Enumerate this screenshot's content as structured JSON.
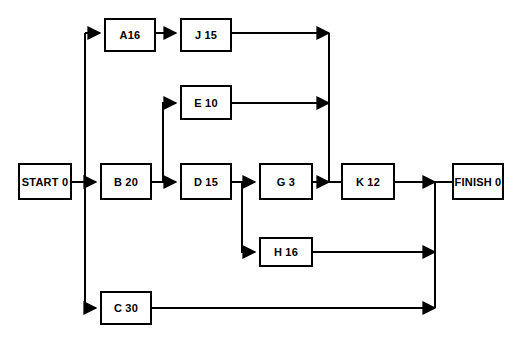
{
  "diagram": {
    "type": "activity-on-node-network",
    "canvas": {
      "width": 524,
      "height": 344
    },
    "style": {
      "background_color": "#ffffff",
      "line_color": "#000000",
      "node_fill": "#ffffff",
      "node_border": "#000000",
      "text_color": "#000000"
    },
    "nodes": [
      {
        "id": "start",
        "label": "START 0",
        "activity": "START",
        "duration": "0",
        "x": 18,
        "y": 163,
        "w": 54,
        "h": 37
      },
      {
        "id": "a",
        "label": "A16",
        "activity": "A",
        "duration": "16",
        "x": 104,
        "y": 18,
        "w": 52,
        "h": 34
      },
      {
        "id": "j",
        "label": "J 15",
        "activity": "J",
        "duration": "15",
        "x": 180,
        "y": 18,
        "w": 52,
        "h": 34
      },
      {
        "id": "e",
        "label": "E 10",
        "activity": "E",
        "duration": "10",
        "x": 180,
        "y": 85,
        "w": 52,
        "h": 35
      },
      {
        "id": "b",
        "label": "B 20",
        "activity": "B",
        "duration": "20",
        "x": 100,
        "y": 163,
        "w": 52,
        "h": 37
      },
      {
        "id": "d",
        "label": "D 15",
        "activity": "D",
        "duration": "15",
        "x": 180,
        "y": 163,
        "w": 52,
        "h": 37
      },
      {
        "id": "g",
        "label": "G 3",
        "activity": "G",
        "duration": "3",
        "x": 259,
        "y": 163,
        "w": 54,
        "h": 37
      },
      {
        "id": "k",
        "label": "K 12",
        "activity": "K",
        "duration": "12",
        "x": 341,
        "y": 163,
        "w": 54,
        "h": 37
      },
      {
        "id": "finish",
        "label": "FINISH 0",
        "activity": "FINISH",
        "duration": "0",
        "x": 452,
        "y": 163,
        "w": 52,
        "h": 37
      },
      {
        "id": "h",
        "label": "H 16",
        "activity": "H",
        "duration": "16",
        "x": 259,
        "y": 237,
        "w": 54,
        "h": 30
      },
      {
        "id": "c",
        "label": "C 30",
        "activity": "C",
        "duration": "30",
        "x": 100,
        "y": 291,
        "w": 52,
        "h": 34
      }
    ],
    "edges": [
      {
        "from": "start",
        "to": "a"
      },
      {
        "from": "start",
        "to": "b"
      },
      {
        "from": "start",
        "to": "c"
      },
      {
        "from": "a",
        "to": "j"
      },
      {
        "from": "j",
        "to": "k"
      },
      {
        "from": "b",
        "to": "e"
      },
      {
        "from": "b",
        "to": "d"
      },
      {
        "from": "e",
        "to": "k"
      },
      {
        "from": "d",
        "to": "g"
      },
      {
        "from": "d",
        "to": "h"
      },
      {
        "from": "g",
        "to": "k"
      },
      {
        "from": "k",
        "to": "finish"
      },
      {
        "from": "h",
        "to": "finish"
      },
      {
        "from": "c",
        "to": "finish"
      }
    ]
  }
}
